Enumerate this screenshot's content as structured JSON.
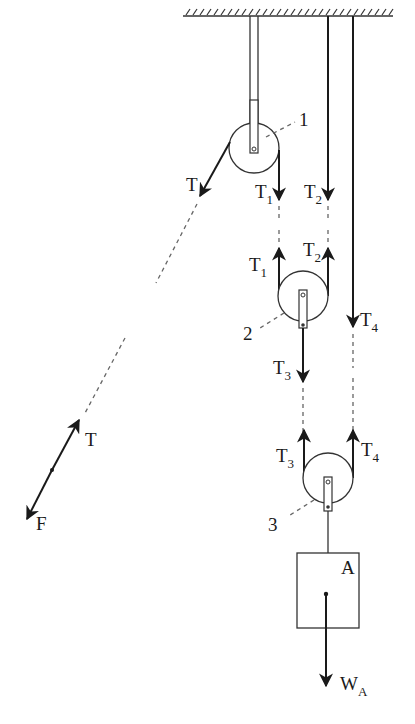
{
  "figure": {
    "type": "free-body diagram of pulley system",
    "ceiling": {
      "label": ""
    },
    "pulleys": [
      {
        "id": "1",
        "label": "1"
      },
      {
        "id": "2",
        "label": "2"
      },
      {
        "id": "3",
        "label": "3"
      }
    ],
    "block": {
      "label": "A"
    },
    "forces": {
      "T": {
        "main": "T",
        "sub": ""
      },
      "T1": {
        "main": "T",
        "sub": "1"
      },
      "T2": {
        "main": "T",
        "sub": "2"
      },
      "T3": {
        "main": "T",
        "sub": "3"
      },
      "T4": {
        "main": "T",
        "sub": "4"
      },
      "F": {
        "main": "F",
        "sub": ""
      },
      "WA": {
        "main": "W",
        "sub": "A"
      }
    }
  }
}
